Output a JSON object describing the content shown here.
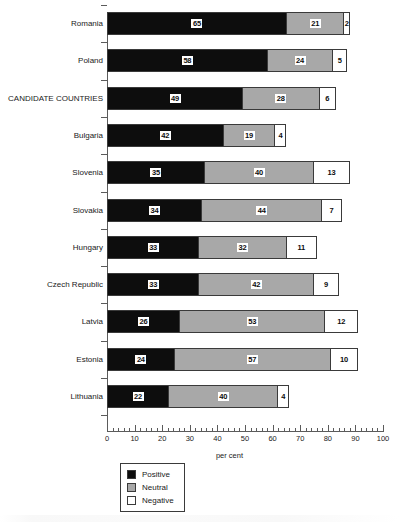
{
  "chart_data": {
    "type": "bar",
    "orientation": "horizontal",
    "stacked": true,
    "title": "",
    "xlabel": "per cent",
    "ylabel": "",
    "xlim": [
      0,
      100
    ],
    "xticks": [
      0,
      10,
      20,
      30,
      40,
      50,
      60,
      70,
      80,
      90,
      100
    ],
    "xtick_labels": [
      "0",
      "10",
      "20",
      "30",
      "40",
      "50",
      "60",
      "70",
      "80",
      "90",
      "100"
    ],
    "minor_tick_interval": 2,
    "grid": false,
    "legend_position": "bottom-left",
    "categories": [
      "Romania",
      "Poland",
      "CANDIDATE COUNTRIES",
      "Bulgaria",
      "Slovenia",
      "Slovakia",
      "Hungary",
      "Czech Republic",
      "Latvia",
      "Estonia",
      "Lithuania"
    ],
    "series": [
      {
        "name": "Positive",
        "color": "#0d0d0d",
        "values": [
          65,
          58,
          49,
          42,
          35,
          34,
          33,
          33,
          26,
          24,
          22
        ]
      },
      {
        "name": "Neutral",
        "color": "#a8a8a8",
        "values": [
          21,
          24,
          28,
          19,
          40,
          44,
          32,
          42,
          53,
          57,
          40
        ]
      },
      {
        "name": "Negative",
        "color": "#ffffff",
        "values": [
          2,
          5,
          6,
          4,
          13,
          7,
          11,
          9,
          12,
          10,
          4
        ]
      }
    ]
  },
  "legend": {
    "items": [
      {
        "label": "Positive",
        "swatch": "positive"
      },
      {
        "label": "Neutral",
        "swatch": "neutral"
      },
      {
        "label": "Negative",
        "swatch": "negative"
      }
    ]
  },
  "axis": {
    "x_title": "per cent"
  }
}
